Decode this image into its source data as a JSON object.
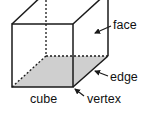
{
  "diagram": {
    "subject": "cube",
    "labels": {
      "face": "face",
      "edge": "edge",
      "vertex": "vertex",
      "cube": "cube"
    },
    "colors": {
      "line": "#1a1a1a",
      "shaded_face": "#cfcfcf",
      "background": "#ffffff"
    }
  }
}
